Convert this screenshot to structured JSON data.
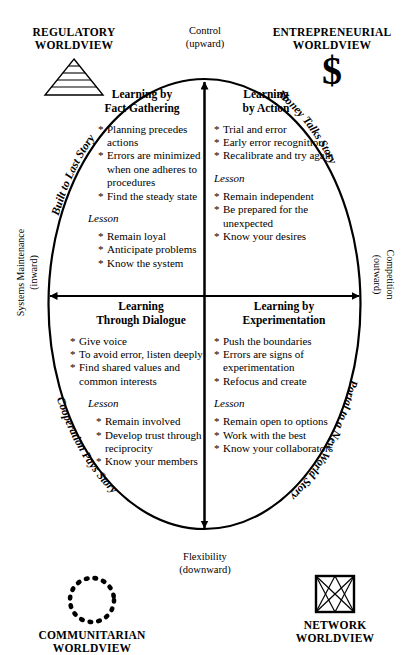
{
  "diagram": {
    "axes": {
      "top": {
        "line1": "Control",
        "line2": "(upward)"
      },
      "bottom": {
        "line1": "Flexibility",
        "line2": "(downward)"
      },
      "left": {
        "line1": "Systems Maintenance",
        "line2": "(inward)"
      },
      "right": {
        "line1": "Competition",
        "line2": "(outward)"
      }
    },
    "corners": {
      "top_left": {
        "line1": "REGULATORY",
        "line2": "WORLDVIEW",
        "icon": "pyramid-icon"
      },
      "top_right": {
        "line1": "ENTREPRENEURIAL",
        "line2": "WORLDVIEW",
        "icon": "dollar-sign-icon",
        "glyph": "$"
      },
      "bottom_left": {
        "line1": "COMMUNITARIAN",
        "line2": "WORLDVIEW",
        "icon": "dotted-circle-icon"
      },
      "bottom_right": {
        "line1": "NETWORK",
        "line2": "WORLDVIEW",
        "icon": "network-square-icon"
      }
    },
    "arc_labels": {
      "upper_left": "Built to Last Story",
      "upper_right": "Money Talks Story",
      "lower_left": "Cooperation Pays Story",
      "lower_right": "Portal to a New World Story"
    },
    "lesson_label": "Lesson",
    "quadrants": {
      "top_left": {
        "title_line1": "Learning by",
        "title_line2": "Fact Gathering",
        "points": [
          "Planning precedes actions",
          "Errors are minimized when one adheres to procedures",
          "Find the steady state"
        ],
        "lesson_points": [
          "Remain loyal",
          "Anticipate problems",
          "Know the system"
        ]
      },
      "top_right": {
        "title_line1": "Learning",
        "title_line2": "by Action",
        "points": [
          "Trial and error",
          "Early error recognition",
          "Recalibrate and try again"
        ],
        "lesson_points": [
          "Remain independent",
          "Be prepared for the unexpected",
          "Know your desires"
        ]
      },
      "bottom_left": {
        "title_line1": "Learning",
        "title_line2": "Through Dialogue",
        "points": [
          "Give voice",
          "To avoid error, listen deeply",
          "Find shared values and common interests"
        ],
        "lesson_points": [
          "Remain involved",
          "Develop trust through reciprocity",
          "Know your members"
        ]
      },
      "bottom_right": {
        "title_line1": "Learning by",
        "title_line2": "Experimentation",
        "points": [
          "Push the boundaries",
          "Errors are signs of experimentation",
          "Refocus and create"
        ],
        "lesson_points": [
          "Remain open to options",
          "Work with the best",
          "Know your collaborators"
        ]
      }
    },
    "colors": {
      "ink": "#000000",
      "background": "#ffffff"
    }
  }
}
